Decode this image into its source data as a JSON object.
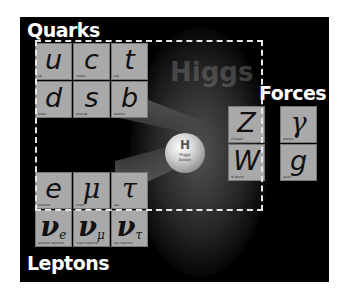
{
  "diagram": {
    "sections": {
      "quarks": "Quarks",
      "leptons": "Leptons",
      "forces": "Forces"
    },
    "quarks": [
      {
        "symbol": "u",
        "name": "up"
      },
      {
        "symbol": "c",
        "name": "charm"
      },
      {
        "symbol": "t",
        "name": "top"
      },
      {
        "symbol": "d",
        "name": "down"
      },
      {
        "symbol": "s",
        "name": "strange"
      },
      {
        "symbol": "b",
        "name": "bottom"
      }
    ],
    "leptons": [
      {
        "symbol": "e",
        "name": "electron"
      },
      {
        "symbol": "μ",
        "name": "muon"
      },
      {
        "symbol": "τ",
        "name": "tau"
      },
      {
        "symbol": "ν",
        "sub": "e",
        "name": "electron neutrino"
      },
      {
        "symbol": "ν",
        "sub": "μ",
        "name": "muon neutrino"
      },
      {
        "symbol": "ν",
        "sub": "τ",
        "name": "tau neutrino"
      }
    ],
    "forces": [
      {
        "symbol": "Z",
        "name": "Z boson"
      },
      {
        "symbol": "γ",
        "name": "photon"
      },
      {
        "symbol": "W",
        "name": "W boson"
      },
      {
        "symbol": "g",
        "name": "gluon"
      }
    ],
    "higgs": {
      "symbol": "H",
      "name_line1": "Higgs",
      "name_line2": "boson"
    },
    "ghost_text": "Higgs",
    "colors": {
      "background": "#000000",
      "tile": "#a9a9a9",
      "dashed_border": "#e6e6e6",
      "title_text": "#ffffff"
    }
  }
}
